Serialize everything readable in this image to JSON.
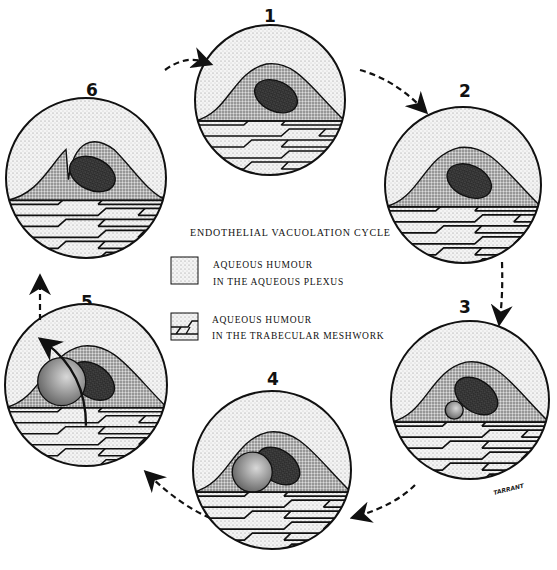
{
  "figure": {
    "title": "ENDOTHELIAL VACUOLATION CYCLE",
    "signature": "TARRANT",
    "stages": [
      {
        "number": "1",
        "description": "Endothelial cell with nucleus, no vacuole"
      },
      {
        "number": "2",
        "description": "Small indentation forms on basal surface"
      },
      {
        "number": "3",
        "description": "Small vacuole forms, opening to trabecular side"
      },
      {
        "number": "4",
        "description": "Large vacuole opening to trabecular meshwork"
      },
      {
        "number": "5",
        "description": "Vacuole opens to both sides; flow arrow through cell"
      },
      {
        "number": "6",
        "description": "Cell returns toward resting state"
      }
    ],
    "legend": [
      {
        "pattern": "dotted",
        "line1": "AQUEOUS HUMOUR",
        "line2": "IN THE AQUEOUS PLEXUS"
      },
      {
        "pattern": "meshwork",
        "line1": "AQUEOUS HUMOUR",
        "line2": "IN THE TRABECULAR MESHWORK"
      }
    ],
    "cycle_direction": "clockwise"
  }
}
